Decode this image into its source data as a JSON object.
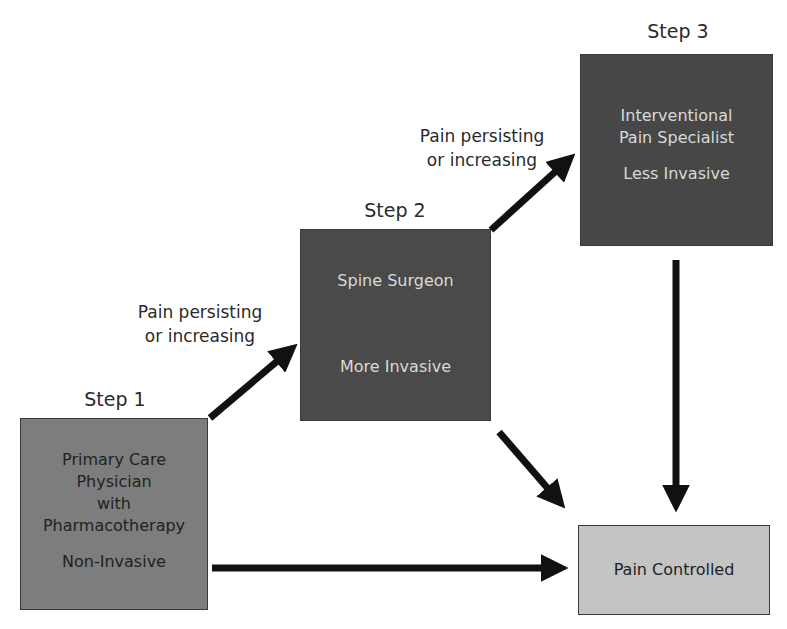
{
  "diagram": {
    "colors": {
      "step1_fill": "#7d7d7d",
      "step2_fill": "#4a4a4a",
      "step3_fill": "#474747",
      "outcome_fill": "#c4c4c4",
      "dark_text": "#222222",
      "light_text": "#d9d9d9",
      "arrow": "#111111"
    },
    "steps": [
      {
        "label": "Step 1",
        "box_lines": [
          "Primary Care",
          "Physician",
          "with",
          "Pharmacotherapy"
        ],
        "invasiveness": "Non-Invasive"
      },
      {
        "label": "Step 2",
        "box_lines": [
          "Spine Surgeon"
        ],
        "invasiveness": "More Invasive"
      },
      {
        "label": "Step 3",
        "box_lines": [
          "Interventional",
          "Pain Specialist"
        ],
        "invasiveness": "Less Invasive"
      }
    ],
    "outcome": {
      "label": "Pain Controlled"
    },
    "edges": [
      {
        "from": "Step 1",
        "to": "Step 2",
        "label_lines": [
          "Pain persisting",
          "or increasing"
        ]
      },
      {
        "from": "Step 2",
        "to": "Step 3",
        "label_lines": [
          "Pain persisting",
          "or increasing"
        ]
      },
      {
        "from": "Step 1",
        "to": "Pain Controlled",
        "label_lines": []
      },
      {
        "from": "Step 2",
        "to": "Pain Controlled",
        "label_lines": []
      },
      {
        "from": "Step 3",
        "to": "Pain Controlled",
        "label_lines": []
      }
    ]
  }
}
